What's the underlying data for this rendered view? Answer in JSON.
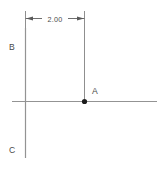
{
  "diagram": {
    "type": "cad-dimension-sketch",
    "background_color": "#ffffff",
    "line_color": "#8a8a8a",
    "dim_line_color": "#6e6e6e",
    "text_color": "#4a4a4a",
    "point_color": "#1c1c1c",
    "dimension": {
      "label": "2.00",
      "from_point": "B",
      "to_point": "A",
      "style": "linear-horizontal",
      "arrowheads": "outward"
    },
    "labels": {
      "a": "A",
      "b": "B",
      "c": "C"
    },
    "points": [
      {
        "name": "A",
        "label": "A",
        "x": 84,
        "y": 101,
        "marker": "filled-dot"
      }
    ],
    "lines": [
      {
        "name": "horizontal-axis",
        "x1": 12,
        "y1": 101,
        "x2": 157,
        "y2": 101
      },
      {
        "name": "vertical-axis",
        "x1": 25,
        "y1": 28,
        "x2": 25,
        "y2": 158
      },
      {
        "name": "extension-line-right",
        "x1": 84,
        "y1": 14,
        "x2": 84,
        "y2": 99
      },
      {
        "name": "extension-line-left",
        "x1": 25,
        "y1": 14,
        "x2": 25,
        "y2": 28
      }
    ]
  }
}
